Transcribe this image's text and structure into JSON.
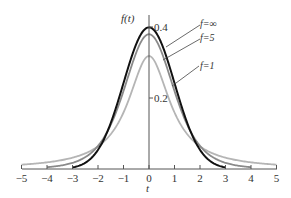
{
  "chart_data": {
    "type": "line",
    "title": "",
    "xlabel": "t",
    "ylabel": "f(t)",
    "xlim": [
      -5,
      5
    ],
    "ylim": [
      0,
      0.42
    ],
    "grid": false,
    "x_ticks": [
      -5,
      -4,
      -3,
      -2,
      -1,
      0,
      1,
      2,
      3,
      4,
      5
    ],
    "x_tick_labels": [
      "−5",
      "−4",
      "−3",
      "−2",
      "−1",
      "0",
      "1",
      "2",
      "3",
      "4",
      "5"
    ],
    "y_ticks": [
      0.2,
      0.4
    ],
    "y_tick_labels": [
      "0.2",
      "0.4"
    ],
    "series": [
      {
        "name": "f=∞",
        "color": "#111111",
        "width": 2.0,
        "kind": "normal",
        "df": null,
        "range": [
          -3,
          3
        ]
      },
      {
        "name": "f=5",
        "color": "#8a8a8a",
        "width": 1.8,
        "kind": "t",
        "df": 5,
        "range": [
          -4,
          4
        ]
      },
      {
        "name": "f=1",
        "color": "#b5b5b5",
        "width": 1.8,
        "kind": "t",
        "df": 1,
        "range": [
          -5,
          5
        ]
      }
    ],
    "annotations": [
      {
        "text": "f=∞",
        "series": "f=∞"
      },
      {
        "text": "f=5",
        "series": "f=5"
      },
      {
        "text": "f=1",
        "series": "f=1"
      }
    ]
  }
}
